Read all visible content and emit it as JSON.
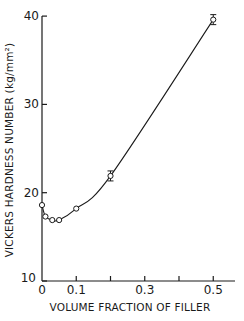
{
  "chart_data": {
    "type": "line",
    "title": "",
    "xlabel": "VOLUME FRACTION OF FILLER",
    "ylabel": "VICKERS HARDNESS NUMBER (kg/mm²)",
    "xlim": [
      0,
      0.55
    ],
    "ylim": [
      10,
      40
    ],
    "x_ticks": [
      0,
      0.1,
      0.2,
      0.3,
      0.4,
      0.5
    ],
    "x_tick_labels": [
      "0",
      "0.1",
      "",
      "0.3",
      "",
      "0.5"
    ],
    "y_ticks": [
      10,
      20,
      30,
      40
    ],
    "y_tick_labels": [
      "10",
      "20",
      "30",
      "40"
    ],
    "grid": false,
    "legend": null,
    "series": [
      {
        "name": "Measured hardness",
        "marker": "open-circle",
        "x": [
          0,
          0.01,
          0.03,
          0.05,
          0.1,
          0.2,
          0.5
        ],
        "values": [
          18.6,
          17.3,
          16.9,
          16.9,
          18.2,
          21.9,
          39.6
        ],
        "error_bars": [
          false,
          false,
          false,
          false,
          false,
          true,
          true
        ]
      }
    ]
  }
}
